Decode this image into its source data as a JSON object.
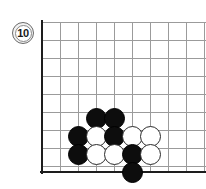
{
  "diagram": {
    "kind": "go-board-diagram",
    "move_number_badge": {
      "label": "10",
      "shape": "circle",
      "fill_color": "#ffffff",
      "border_color": "#6a6a6a",
      "text_color": "#1a1a1a"
    },
    "board": {
      "corner": "lower-left",
      "line_color": "#9b9b9b",
      "edge_color": "#1d1d1d",
      "grid_spacing_px": 18,
      "origin_x_px": 42,
      "origin_y_px": 172,
      "columns": 10,
      "rows": 9
    },
    "stones": {
      "black_color": "#0d0d0d",
      "white_color": "#ffffff",
      "white_border_color": "#2b2b2b",
      "items": [
        {
          "color": "black",
          "cx": 96,
          "cy": 118
        },
        {
          "color": "black",
          "cx": 114,
          "cy": 118
        },
        {
          "color": "black",
          "cx": 78,
          "cy": 136
        },
        {
          "color": "white",
          "cx": 96,
          "cy": 136
        },
        {
          "color": "black",
          "cx": 114,
          "cy": 136
        },
        {
          "color": "white",
          "cx": 132,
          "cy": 136
        },
        {
          "color": "white",
          "cx": 150,
          "cy": 136
        },
        {
          "color": "black",
          "cx": 78,
          "cy": 154
        },
        {
          "color": "white",
          "cx": 96,
          "cy": 154
        },
        {
          "color": "white",
          "cx": 114,
          "cy": 154
        },
        {
          "color": "black",
          "cx": 132,
          "cy": 154
        },
        {
          "color": "white",
          "cx": 150,
          "cy": 154
        },
        {
          "color": "black",
          "cx": 132,
          "cy": 172
        }
      ]
    },
    "gridlines": {
      "vertical_x": [
        42,
        60,
        78,
        96,
        114,
        132,
        150,
        168,
        186,
        204
      ],
      "horizontal_y": [
        22,
        40,
        58,
        76,
        94,
        112,
        130,
        148,
        166,
        172
      ]
    }
  }
}
